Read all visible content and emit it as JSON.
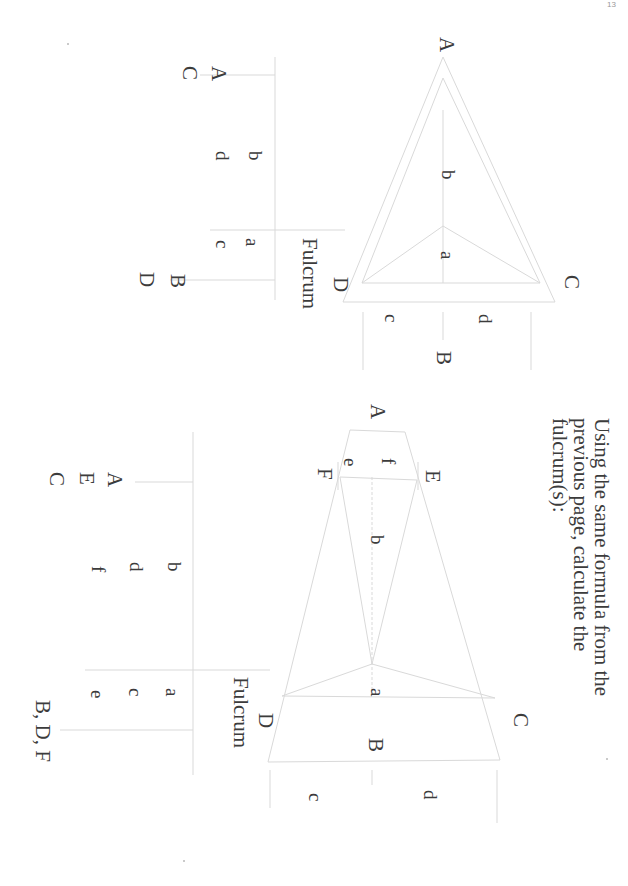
{
  "page": {
    "page_number": "13",
    "orientation": "rotated 90deg clockwise"
  },
  "figure1": {
    "vertices": {
      "A": "A",
      "B": "B",
      "C": "C",
      "D": "D"
    },
    "segments": {
      "a": "a",
      "b": "b",
      "c": "c",
      "d": "d"
    },
    "table": {
      "header": "Fulcrum",
      "left_col": {
        "top": "b",
        "bottom": "d"
      },
      "right_col": {
        "top": "a",
        "bottom": "c"
      },
      "row_labels": {
        "r1": "A",
        "r2": "C"
      },
      "result_labels": {
        "r1": "B",
        "r2": "D"
      }
    }
  },
  "instruction": {
    "lines": [
      "Using the same formula from the",
      "previous page, calculate the",
      "fulcrum(s):"
    ]
  },
  "figure2": {
    "vertices": {
      "A": "A",
      "B": "B",
      "C": "C",
      "D": "D",
      "E": "E",
      "F": "F"
    },
    "segments": {
      "a": "a",
      "b": "b",
      "c": "c",
      "d": "d",
      "e": "e",
      "f": "f"
    },
    "table": {
      "header": "Fulcrum",
      "left_col": {
        "r1": "b",
        "r2": "d",
        "r3": "f"
      },
      "right_col": {
        "r1": "a",
        "r2": "c",
        "r3": "e"
      },
      "row_labels": {
        "r1": "A",
        "r2": "E",
        "r3": "C"
      },
      "result": "B, D, F"
    }
  },
  "colors": {
    "ink": "#3c3c3c",
    "line": "#d6d6d6",
    "paper": "#ffffff"
  }
}
